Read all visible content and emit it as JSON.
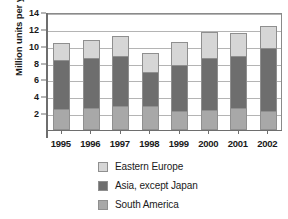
{
  "chart_data": {
    "type": "bar",
    "subtype": "stacked-bar",
    "title": "",
    "xlabel": "",
    "ylabel": "Million units per year",
    "categories": [
      "1995",
      "1996",
      "1997",
      "1998",
      "1999",
      "2000",
      "2001",
      "2002"
    ],
    "ylim": [
      0,
      14
    ],
    "yticks": [
      2,
      4,
      6,
      8,
      10,
      12,
      14
    ],
    "grid": true,
    "legend_position": "bottom-left",
    "series": [
      {
        "name": "South America",
        "color": "#a8a8a8",
        "values": [
          2.5,
          2.6,
          2.9,
          2.8,
          2.3,
          2.4,
          2.6,
          2.3
        ]
      },
      {
        "name": "Asia, except Japan",
        "color": "#6e6e6e",
        "values": [
          5.8,
          5.9,
          5.9,
          4.1,
          5.4,
          6.2,
          6.2,
          7.4
        ]
      },
      {
        "name": "Eastern Europe",
        "color": "#d6d6d6",
        "values": [
          2.0,
          2.2,
          2.4,
          2.2,
          2.8,
          3.0,
          2.7,
          2.6
        ]
      }
    ],
    "cumulative_tops": {
      "south_america": [
        2.5,
        2.6,
        2.9,
        2.8,
        2.3,
        2.4,
        2.6,
        2.3
      ],
      "asia_except_japan": [
        8.3,
        8.5,
        8.8,
        6.9,
        7.7,
        8.6,
        8.8,
        9.7
      ],
      "total": [
        10.3,
        10.7,
        11.2,
        9.1,
        10.5,
        11.6,
        11.5,
        12.3
      ]
    }
  },
  "legend": {
    "items": [
      {
        "label": "Eastern Europe",
        "color": "#d6d6d6"
      },
      {
        "label": "Asia, except Japan",
        "color": "#6e6e6e"
      },
      {
        "label": "South America",
        "color": "#a8a8a8"
      }
    ]
  }
}
